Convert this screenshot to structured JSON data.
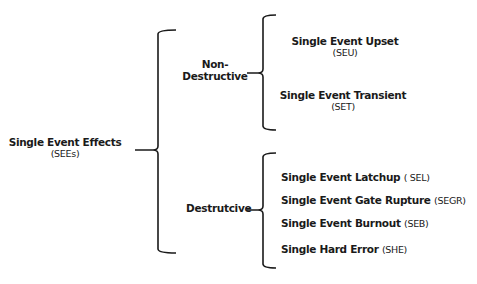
{
  "root": {
    "label": "Single Event Effects",
    "abbr": "(SEEs)"
  },
  "categories": [
    {
      "label_line1": "Non-",
      "label_line2": "Destructive",
      "items": [
        {
          "label": "Single Event Upset",
          "abbr": "(SEU)"
        },
        {
          "label": "Single Event Transient",
          "abbr": "(SET)"
        }
      ]
    },
    {
      "label": "Destrutcive",
      "items": [
        {
          "label": "Single Event Latchup",
          "abbr": "( SEL)"
        },
        {
          "label": "Single Event Gate Rupture",
          "abbr": "(SEGR)"
        },
        {
          "label": "Single Event  Burnout",
          "abbr": "(SEB)"
        },
        {
          "label": "Single Hard Error",
          "abbr": "(SHE)"
        }
      ]
    }
  ],
  "colors": {
    "line": "#1a1a1a",
    "text": "#1a1a1a",
    "background": "#ffffff"
  }
}
